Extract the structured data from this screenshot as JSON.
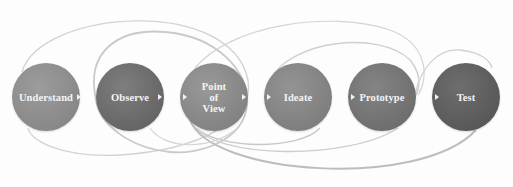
{
  "diagram": {
    "title": "",
    "type": "process-flow",
    "nodes": [
      {
        "id": "understand",
        "label": "Understand",
        "cx": 46,
        "cy": 97,
        "color": "#8e8e8e"
      },
      {
        "id": "observe",
        "label": "Observe",
        "cx": 130,
        "cy": 97,
        "color": "#6e6e6e"
      },
      {
        "id": "point-of-view",
        "label": "Point\nof\nView",
        "cx": 214,
        "cy": 97,
        "color": "#8a8a8a"
      },
      {
        "id": "ideate",
        "label": "Ideate",
        "cx": 298,
        "cy": 97,
        "color": "#858585"
      },
      {
        "id": "prototype",
        "label": "Prototype",
        "cx": 382,
        "cy": 97,
        "color": "#737373"
      },
      {
        "id": "test",
        "label": "Test",
        "cx": 466,
        "cy": 97,
        "color": "#5e5e5e"
      }
    ],
    "connector_arrows": [
      {
        "from": "understand",
        "to": "observe"
      },
      {
        "from": "observe",
        "to": "point-of-view"
      },
      {
        "from": "point-of-view",
        "to": "ideate"
      },
      {
        "from": "ideate",
        "to": "prototype"
      },
      {
        "from": "prototype",
        "to": "test"
      }
    ],
    "loop_arcs_color": "#cfcfcf",
    "background_color": "#fdfdfd"
  }
}
